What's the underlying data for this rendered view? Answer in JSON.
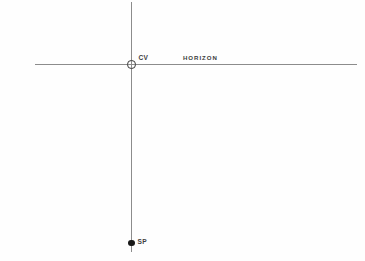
{
  "diagram": {
    "type": "perspective-construction",
    "background_color": "#fefefe",
    "line_color": "#8c8c8c",
    "label_color": "#3d3d3d",
    "marker_color": "#181818",
    "labels": {
      "center_of_vision": "CV",
      "horizon": "HORIZON",
      "station_point": "SP"
    },
    "markers": [
      {
        "name": "center-of-vision",
        "label": "CV",
        "style": "open-circle",
        "x": 131.5,
        "y": 64.5,
        "diameter": 9
      },
      {
        "name": "station-point",
        "label": "SP",
        "style": "filled-dot",
        "x": 131.8,
        "y": 243,
        "diameter": 7
      }
    ],
    "lines": [
      {
        "name": "horizon-line",
        "orientation": "horizontal",
        "y": 64.5,
        "x_start": 35,
        "x_end": 357,
        "color": "#8c8c8c"
      },
      {
        "name": "vertical-axis",
        "orientation": "vertical",
        "x": 131.5,
        "y_start": 2,
        "y_end": 252,
        "color": "#8c8c8c"
      }
    ]
  }
}
